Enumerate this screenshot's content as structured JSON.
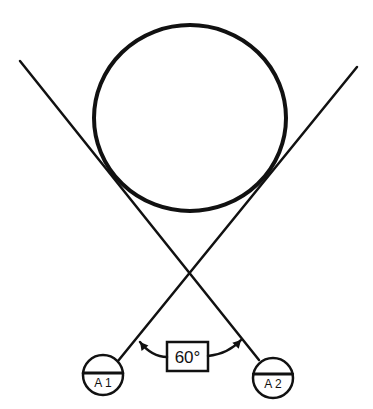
{
  "diagram": {
    "type": "tangent-lines-around-circle",
    "colors": {
      "stroke": "#111111",
      "background": "#ffffff"
    },
    "main_circle": {
      "cx": 190,
      "cy": 118,
      "rx": 96,
      "ry": 93,
      "stroke_width": 4
    },
    "lines": [
      {
        "id": "line-left-to-A2",
        "x1": 20,
        "y1": 61,
        "x2": 259,
        "y2": 360,
        "stroke_width": 2.5
      },
      {
        "id": "line-right-to-A1",
        "x1": 357,
        "y1": 67,
        "x2": 118,
        "y2": 361,
        "stroke_width": 2.5
      }
    ],
    "crossing_point": {
      "x": 190,
      "y": 270
    },
    "markers": [
      {
        "id": "A1",
        "label": "A 1",
        "cx": 103,
        "cy": 375,
        "r": 20,
        "divider_y": 373
      },
      {
        "id": "A2",
        "label": "A 2",
        "cx": 273,
        "cy": 378,
        "r": 20,
        "divider_y": 374
      }
    ],
    "angle": {
      "label": "60°",
      "box": {
        "x": 167,
        "y": 342,
        "width": 41,
        "height": 29
      },
      "left_arc": {
        "from": [
          140,
          342
        ],
        "ctrl": [
          152,
          357
        ],
        "to": [
          167,
          357
        ]
      },
      "right_arc": {
        "from": [
          208,
          356
        ],
        "ctrl": [
          228,
          354
        ],
        "to": [
          241,
          340
        ]
      }
    }
  }
}
